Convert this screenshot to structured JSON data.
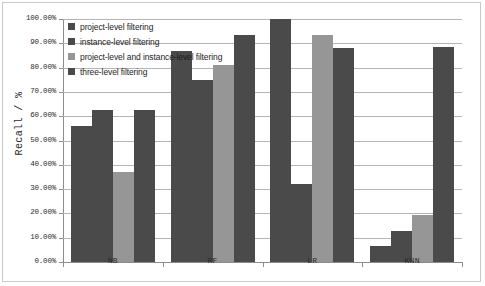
{
  "chart_data": {
    "type": "bar",
    "title": "",
    "xlabel": "",
    "ylabel": "Recall / %",
    "ylim": [
      0,
      100
    ],
    "ytick_step": 10,
    "grid": true,
    "legend_position": "top-left inside plot",
    "categories": [
      "NB",
      "RF",
      "LR",
      "KNN"
    ],
    "ytick_labels": [
      "100.00%",
      "90.00%",
      "80.00%",
      "70.00%",
      "60.00%",
      "50.00%",
      "40.00%",
      "30.00%",
      "20.00%",
      "10.00%",
      "0.00%"
    ],
    "ytick_values": [
      100,
      90,
      80,
      70,
      60,
      50,
      40,
      30,
      20,
      10,
      0
    ],
    "series": [
      {
        "name": "project-level filtering",
        "color": "#4a4a4a",
        "values": [
          56.0,
          87.0,
          100.0,
          6.5
        ]
      },
      {
        "name": "instance-level filtering",
        "color": "#4a4a4a",
        "values": [
          62.5,
          75.0,
          32.0,
          12.8
        ]
      },
      {
        "name": "project-level and instance-level filtering",
        "color": "#969696",
        "values": [
          37.0,
          81.0,
          93.5,
          19.5
        ]
      },
      {
        "name": "three-level filtering",
        "color": "#4a4a4a",
        "values": [
          62.5,
          93.5,
          88.0,
          88.5
        ]
      }
    ]
  },
  "legend": {
    "items": [
      {
        "label": "project-level filtering",
        "color": "#4a4a4a"
      },
      {
        "label": "instance-level filtering",
        "color": "#4a4a4a"
      },
      {
        "label": "project-level and instance-level filtering",
        "color": "#969696"
      },
      {
        "label": "three-level filtering",
        "color": "#4a4a4a"
      }
    ]
  }
}
